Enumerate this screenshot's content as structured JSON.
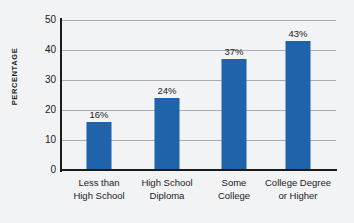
{
  "chart_data": {
    "type": "bar",
    "title": "",
    "xlabel": "",
    "ylabel": "PERCENTAGE",
    "categories": [
      "Less than High School",
      "High School Diploma",
      "Some College",
      "College Degree or Higher"
    ],
    "category_lines": [
      [
        "Less than",
        "High School"
      ],
      [
        "High School",
        "Diploma"
      ],
      [
        "Some",
        "College"
      ],
      [
        "College Degree",
        "or Higher"
      ]
    ],
    "values": [
      16,
      24,
      37,
      43
    ],
    "value_labels": [
      "16%",
      "24%",
      "37%",
      "43%"
    ],
    "ylim": [
      0,
      50
    ],
    "yticks": [
      0,
      10,
      20,
      30,
      40,
      50
    ],
    "ytick_labels": [
      "0",
      "10",
      "20",
      "30",
      "40",
      "50"
    ],
    "grid": true,
    "legend": "none",
    "colors": {
      "bar": "#1f63ab",
      "background": "#f2f3f4",
      "axis": "#1b1b1b",
      "gridline": "#a9adb1",
      "text": "#1a1a1a"
    }
  }
}
